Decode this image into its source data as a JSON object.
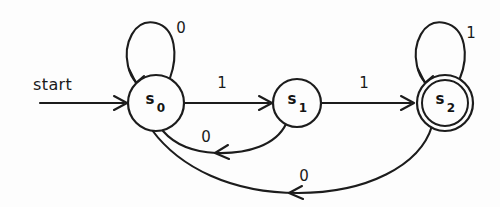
{
  "figure": {
    "kind": "finite-state-machine-diagram",
    "background_color": "#fdfdfd",
    "ink_color": "#1c1c1c",
    "width": 500,
    "height": 207
  },
  "start": {
    "label": "start",
    "arrow_target": "s0"
  },
  "states": [
    {
      "id": "s0",
      "name": "s",
      "subscript": "0",
      "is_start": true,
      "is_accepting": false,
      "cx": 156,
      "cy": 103,
      "r": 28
    },
    {
      "id": "s1",
      "name": "s",
      "subscript": "1",
      "is_start": false,
      "is_accepting": false,
      "cx": 297,
      "cy": 103,
      "r": 24
    },
    {
      "id": "s2",
      "name": "s",
      "subscript": "2",
      "is_start": false,
      "is_accepting": true,
      "cx": 445,
      "cy": 103,
      "r": 28,
      "inner_r": 23
    }
  ],
  "transitions": [
    {
      "id": "t-s0-s0",
      "from": "s0",
      "to": "s0",
      "label": "0",
      "kind": "self-loop",
      "label_x": 181,
      "label_y": 33
    },
    {
      "id": "t-s0-s1",
      "from": "s0",
      "to": "s1",
      "label": "1",
      "kind": "straight",
      "label_x": 222,
      "label_y": 88
    },
    {
      "id": "t-s1-s0",
      "from": "s1",
      "to": "s0",
      "label": "0",
      "kind": "curve-below",
      "label_x": 206,
      "label_y": 142
    },
    {
      "id": "t-s1-s2",
      "from": "s1",
      "to": "s2",
      "label": "1",
      "kind": "straight",
      "label_x": 364,
      "label_y": 88
    },
    {
      "id": "t-s2-s2",
      "from": "s2",
      "to": "s2",
      "label": "1",
      "kind": "self-loop",
      "label_x": 471,
      "label_y": 38
    },
    {
      "id": "t-s2-s0",
      "from": "s2",
      "to": "s0",
      "label": "0",
      "kind": "curve-below-long",
      "label_x": 304,
      "label_y": 181
    }
  ]
}
